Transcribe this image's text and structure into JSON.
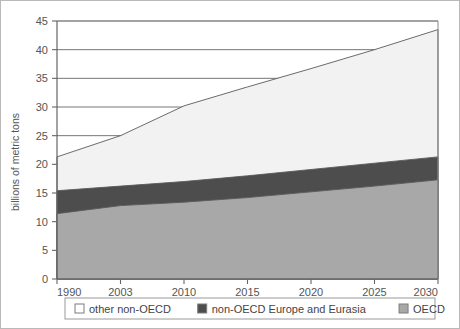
{
  "chart_data": {
    "type": "area",
    "stacked": true,
    "title": "",
    "subtitle": "",
    "xlabel": "",
    "ylabel": "billions of metric tons",
    "categories": [
      "1990",
      "2003",
      "2010",
      "2015",
      "2020",
      "2025",
      "2030"
    ],
    "x_tick_labels": [
      "1990",
      "2003",
      "2010",
      "2015",
      "2020",
      "2025",
      "2030"
    ],
    "y_tick_labels": [
      "0",
      "5",
      "10",
      "15",
      "20",
      "25",
      "30",
      "35",
      "40",
      "45"
    ],
    "y_ticks": [
      0,
      5,
      10,
      15,
      20,
      25,
      30,
      35,
      40,
      45
    ],
    "ylim": [
      0,
      45
    ],
    "grid": "horizontal",
    "legend_position": "bottom",
    "series": [
      {
        "name": "OECD",
        "order": 1,
        "color": "#a8a8a8",
        "values": [
          11.4,
          12.8,
          13.4,
          14.2,
          15.2,
          16.2,
          17.3
        ]
      },
      {
        "name": "non-OECD Europe and Eurasia",
        "order": 2,
        "color": "#4d4d4d",
        "values": [
          4.0,
          3.4,
          3.6,
          3.8,
          3.9,
          4.0,
          4.0
        ]
      },
      {
        "name": "other non-OECD",
        "order": 3,
        "color": "#f2f2f2",
        "values": [
          5.9,
          8.8,
          13.2,
          15.5,
          17.6,
          19.8,
          22.2
        ]
      }
    ],
    "cumulative_tops": {
      "OECD": [
        11.4,
        12.8,
        13.4,
        14.2,
        15.2,
        16.2,
        17.3
      ],
      "non-OECD Europe and Eurasia": [
        15.4,
        16.2,
        17.0,
        18.0,
        19.1,
        20.2,
        21.3
      ],
      "other non-OECD": [
        21.3,
        25.0,
        30.2,
        33.5,
        36.7,
        40.0,
        43.5
      ]
    }
  },
  "legend": {
    "items": [
      {
        "label": "other non-OECD",
        "swatch": "#ffffff"
      },
      {
        "label": "non-OECD Europe and Eurasia",
        "swatch": "#4d4d4d"
      },
      {
        "label": "OECD",
        "swatch": "#a8a8a8"
      }
    ]
  },
  "colors": {
    "border": "#b9b9b9",
    "axis": "#666666",
    "grid": "#666666",
    "text": "#555555"
  }
}
